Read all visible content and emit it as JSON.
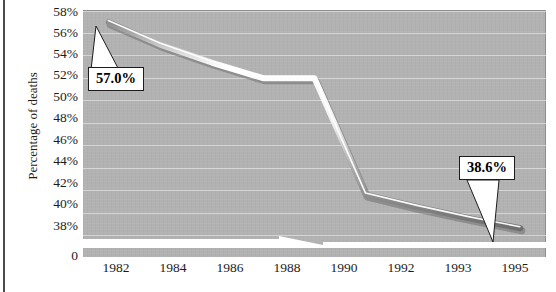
{
  "chart_data": {
    "type": "line",
    "title": "",
    "xlabel": "",
    "ylabel": "Percentage of deaths",
    "categories": [
      "1982",
      "1984",
      "1986",
      "1988",
      "1990",
      "1992",
      "1993",
      "1995",
      "1997"
    ],
    "x": [
      "1982",
      "1984",
      "1986",
      "1988",
      "1990",
      "1992",
      "1993",
      "1995",
      "1997"
    ],
    "values": [
      57.0,
      55.0,
      53.4,
      52.0,
      52.0,
      41.6,
      40.5,
      39.5,
      38.6
    ],
    "series": [
      {
        "name": "Percentage of deaths",
        "values": [
          57.0,
          55.0,
          53.4,
          52.0,
          52.0,
          41.6,
          40.5,
          39.5,
          38.6
        ]
      }
    ],
    "ylim": [
      38,
      58
    ],
    "yticks": [
      "38%",
      "40%",
      "42%",
      "44%",
      "46%",
      "48%",
      "50%",
      "52%",
      "54%",
      "56%",
      "58%"
    ],
    "ytick_values": [
      38,
      40,
      42,
      44,
      46,
      48,
      50,
      52,
      54,
      56,
      58
    ],
    "y_axis_break_label": "0",
    "y_axis_has_break": true,
    "grid": true,
    "legend": false,
    "legend_position": "none",
    "annotations": [
      {
        "text": "57.0%",
        "target_category": "1982",
        "target_value": 57.0
      },
      {
        "text": "38.6%",
        "target_category": "1997",
        "target_value": 38.6
      }
    ],
    "colors": {
      "plot_background": "#b2b2b2",
      "gridline": "#e2e2e2",
      "line_highlight": "#ffffff",
      "line_shadow": "#6e6e6e",
      "text": "#1c1c1c",
      "callout_border": "#1c1c1c",
      "callout_background": "#ffffff"
    }
  },
  "axis": {
    "y_title": "Percentage of deaths",
    "y_ticks": [
      {
        "label": "58%"
      },
      {
        "label": "56%"
      },
      {
        "label": "54%"
      },
      {
        "label": "52%"
      },
      {
        "label": "50%"
      },
      {
        "label": "48%"
      },
      {
        "label": "46%"
      },
      {
        "label": "44%"
      },
      {
        "label": "42%"
      },
      {
        "label": "40%"
      },
      {
        "label": "38%"
      },
      {
        "label": "0"
      }
    ],
    "x_ticks": [
      {
        "label": "1982"
      },
      {
        "label": "1984"
      },
      {
        "label": "1986"
      },
      {
        "label": "1988"
      },
      {
        "label": "1990"
      },
      {
        "label": "1992"
      },
      {
        "label": "1993"
      },
      {
        "label": "1995"
      },
      {
        "label": "1997"
      }
    ]
  },
  "callouts": {
    "first": {
      "text": "57.0%"
    },
    "last": {
      "text": "38.6%"
    }
  }
}
